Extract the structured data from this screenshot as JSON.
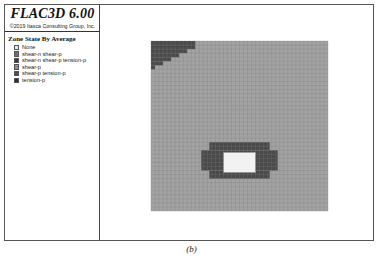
{
  "header": {
    "app_title": "FLAC3D 6.00",
    "copyright": "©2019 Itasca Consulting Group, Inc."
  },
  "legend": {
    "title": "Zone State By Average",
    "items": [
      {
        "label": "None",
        "color": "#e6e6e6"
      },
      {
        "label": "shear-n shear-p",
        "color": "#6e6e6e"
      },
      {
        "label": "shear-n shear-p tension-p",
        "color": "#3a3a3a"
      },
      {
        "label": "shear-p",
        "color": "#8c8c8c"
      },
      {
        "label": "shear-p tension-p",
        "color": "#4f4f4f"
      },
      {
        "label": "tension-p",
        "color": "#2e2e2e"
      }
    ]
  },
  "model": {
    "grid_columns": 44,
    "grid_rows": 42,
    "base_color": "#a3a3a3",
    "grid_line_color": "#7d7d7d",
    "yield_zone_color": "#4a4a4a",
    "opening_color": "#f2f2f2"
  },
  "caption": "(b)"
}
